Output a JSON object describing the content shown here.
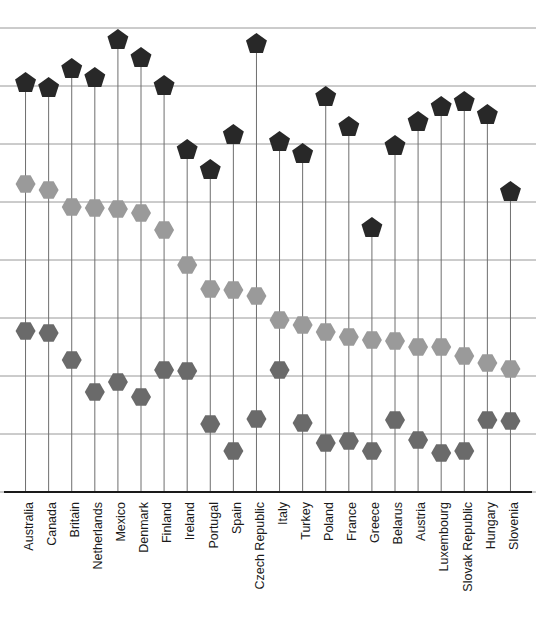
{
  "chart_data": {
    "type": "scatter",
    "title": "",
    "subtitle": "",
    "xlabel": "",
    "ylabel": "",
    "grid": true,
    "legend_position": "none",
    "axis": {
      "x_range_px": [
        14,
        522
      ],
      "y_top_gridline_px": 28,
      "y_bottom_axis_px": 492,
      "gridline_count": 9,
      "gridline_spacing_px": 58,
      "y_axis_visible_ticks": false,
      "x_axis_visible": true
    },
    "categories": [
      "Australia",
      "Canada",
      "Britain",
      "Netherlands",
      "Mexico",
      "Denmark",
      "Finland",
      "Ireland",
      "Portugal",
      "Spain",
      "Czech Republic",
      "Italy",
      "Turkey",
      "Poland",
      "France",
      "Greece",
      "Belarus",
      "Austria",
      "Luxembourg",
      "Slovak Republic",
      "Hungary",
      "Slovenia"
    ],
    "series": [
      {
        "name": "high",
        "marker": "pentagon",
        "color": "#282828",
        "values_px": [
          83,
          88,
          69,
          78,
          40,
          58,
          86,
          150,
          170,
          135,
          44,
          142,
          154,
          97,
          127,
          228,
          146,
          122,
          107,
          102,
          115,
          192
        ]
      },
      {
        "name": "mid",
        "marker": "hexagon",
        "color": "#9a9a9a",
        "values_px": [
          184,
          190,
          207,
          208,
          209,
          213,
          230,
          265,
          289,
          290,
          296,
          320,
          325,
          332,
          337,
          340,
          341,
          347,
          347,
          356,
          363,
          369
        ]
      },
      {
        "name": "low",
        "marker": "hexagon",
        "color": "#6a6a6a",
        "values_px": [
          331,
          333,
          360,
          392,
          382,
          397,
          370,
          371,
          424,
          451,
          419,
          370,
          423,
          443,
          441,
          451,
          420,
          440,
          453,
          451,
          420,
          421
        ]
      }
    ]
  }
}
